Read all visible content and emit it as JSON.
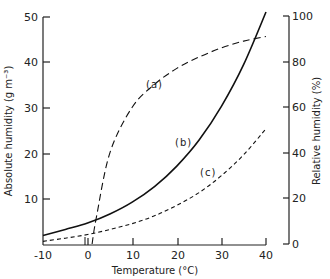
{
  "chart_data": {
    "type": "line",
    "title": "",
    "xlabel": "Temperature (°C)",
    "ylabel": "Absolute humidity (g m⁻³)",
    "y2label": "Relative humidity (%)",
    "xlim": [
      -10,
      40
    ],
    "ylim": [
      0,
      50
    ],
    "y2lim": [
      0,
      100
    ],
    "x_ticks": [
      "-10",
      "0",
      "10",
      "20",
      "30",
      "40"
    ],
    "y_ticks": [
      "10",
      "20",
      "30",
      "40",
      "50"
    ],
    "y2_ticks": [
      "0",
      "20",
      "40",
      "60",
      "80",
      "100"
    ],
    "grid": false,
    "legend": "none (curves labelled inline)",
    "series": [
      {
        "name": "(a)",
        "axis": "right",
        "style": "long-dashed",
        "x": [
          1,
          2,
          5,
          10,
          15,
          20,
          25,
          30,
          35,
          40
        ],
        "values": [
          0,
          12,
          40,
          60,
          70,
          77,
          82,
          86,
          89,
          91
        ]
      },
      {
        "name": "(b)",
        "axis": "left",
        "style": "solid",
        "x": [
          -10,
          -5,
          0,
          5,
          10,
          15,
          20,
          25,
          30,
          35,
          40
        ],
        "values": [
          2.1,
          3.4,
          4.8,
          6.8,
          9.4,
          12.8,
          17.3,
          23.0,
          30.4,
          39.6,
          51.1
        ]
      },
      {
        "name": "(c)",
        "axis": "left",
        "style": "short-dashed",
        "x": [
          -10,
          -5,
          0,
          5,
          10,
          15,
          20,
          25,
          30,
          35,
          40
        ],
        "values": [
          0.8,
          1.5,
          2.3,
          3.4,
          4.7,
          6.4,
          8.7,
          11.5,
          15.2,
          19.8,
          25.5
        ]
      }
    ]
  },
  "labels": {
    "a": "(a)",
    "b": "(b)",
    "c": "(c)"
  }
}
